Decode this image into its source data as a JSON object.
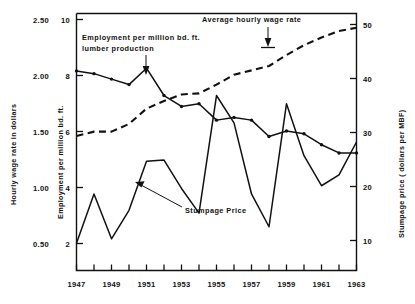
{
  "chart_data": {
    "type": "line",
    "title": "",
    "xlabel": "",
    "x": [
      1947,
      1948,
      1949,
      1950,
      1951,
      1952,
      1953,
      1954,
      1955,
      1956,
      1957,
      1958,
      1959,
      1960,
      1961,
      1962,
      1963
    ],
    "xlim": [
      1947,
      1963
    ],
    "xticks": [
      1947,
      1949,
      1951,
      1953,
      1955,
      1957,
      1959,
      1961,
      1963
    ],
    "xticklabels": [
      "1947",
      "1949",
      "1951",
      "1953",
      "1955",
      "1957",
      "1959",
      "1961",
      "1963"
    ],
    "grid": false,
    "legend_position": "inline-annotations",
    "axes": [
      {
        "id": "wage",
        "side": "left-outer",
        "label": "Hourly wage rate in dollars",
        "ticks": [
          0.5,
          1.0,
          1.5,
          2.0,
          2.5
        ],
        "ticklabels": [
          "0.50",
          "1.00",
          "1.50",
          "2.00",
          "2.50"
        ],
        "lim": [
          0.25,
          2.6
        ]
      },
      {
        "id": "employment",
        "side": "left-inner",
        "label": "Employment per million bd. ft.",
        "ticks": [
          2,
          4,
          6,
          8,
          10
        ],
        "ticklabels": [
          "2",
          "4",
          "6",
          "8",
          "10"
        ],
        "lim": [
          1.0,
          10.4
        ]
      },
      {
        "id": "stumpage",
        "side": "right",
        "label": "Stumpage price ( dollars per MBF)",
        "ticks": [
          10,
          20,
          30,
          40,
          50
        ],
        "ticklabels": [
          "10",
          "20",
          "30",
          "40",
          "50"
        ],
        "lim": [
          5,
          52
        ]
      }
    ],
    "series": [
      {
        "name": "Employment per million bd. ft. lumber production",
        "axis": "employment",
        "style": "solid",
        "markers": true,
        "unit": "employees per million bd. ft.",
        "values": [
          8.3,
          8.2,
          8.0,
          7.8,
          8.4,
          7.4,
          7.0,
          7.1,
          6.5,
          6.6,
          6.5,
          5.9,
          6.1,
          6.0,
          5.6,
          5.3,
          5.3
        ]
      },
      {
        "name": "Average hourly wage rate",
        "axis": "wage",
        "style": "dashed",
        "markers": false,
        "unit": "dollars per hour",
        "values": [
          1.48,
          1.52,
          1.52,
          1.59,
          1.73,
          1.8,
          1.86,
          1.87,
          1.95,
          2.04,
          2.08,
          2.12,
          2.22,
          2.31,
          2.38,
          2.44,
          2.47
        ]
      },
      {
        "name": "Stumpage Price",
        "axis": "stumpage",
        "style": "solid",
        "markers": false,
        "unit": "dollars per MBF",
        "values": [
          10.0,
          19.0,
          10.8,
          16.0,
          25.0,
          25.2,
          20.0,
          15.5,
          37.0,
          32.0,
          19.0,
          13.0,
          35.5,
          26.0,
          20.5,
          22.5,
          28.5
        ]
      }
    ],
    "annotations": [
      {
        "id": "employment-annotation",
        "text_line1": "Employment per million bd. ft.",
        "text_line2": "lumber  production",
        "points_to_year": 1950
      },
      {
        "id": "wage-annotation",
        "text_line1": "Average hourly wage rate",
        "text_line2": "",
        "points_to_year": 1957
      },
      {
        "id": "stumpage-annotation",
        "text_line1": "Stumpage Price",
        "text_line2": "",
        "points_to_year": 1950.8
      }
    ]
  }
}
